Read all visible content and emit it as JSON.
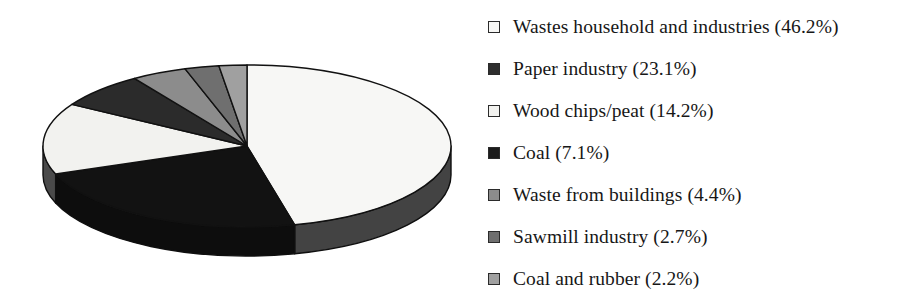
{
  "chart_data": {
    "type": "pie",
    "title": "",
    "subtitle": "",
    "xlabel": "",
    "ylabel": "",
    "legend_position": "right",
    "grid": false,
    "three_d": true,
    "units": "%",
    "start_angle_deg": 0,
    "direction": "clockwise",
    "categories": [
      "Wastes household and industries",
      "Paper industry",
      "Wood chips/peat",
      "Coal",
      "Waste from buildings",
      "Sawmill industry",
      "Coal and rubber"
    ],
    "values": [
      46.2,
      23.1,
      14.2,
      7.1,
      4.4,
      2.7,
      2.2
    ],
    "colors": [
      "#f7f7f5",
      "#121212",
      "#f2f2ef",
      "#2b2b2b",
      "#8c8c8c",
      "#6f6f6f",
      "#a0a0a0"
    ],
    "slices": [
      {
        "label": "Wastes household and industries",
        "value": 46.2,
        "display": "46.2%",
        "color": "#f7f7f5",
        "side_color": "#434343"
      },
      {
        "label": "Paper industry",
        "value": 23.1,
        "display": "23.1%",
        "color": "#121212",
        "side_color": "#0d0d0d"
      },
      {
        "label": "Wood chips/peat",
        "value": 14.2,
        "display": "14.2%",
        "color": "#f2f2ef",
        "side_color": "#4a4a4a"
      },
      {
        "label": "Coal",
        "value": 7.1,
        "display": "7.1%",
        "color": "#2b2b2b",
        "side_color": "#1f1f1f"
      },
      {
        "label": "Waste from buildings",
        "value": 4.4,
        "display": "4.4%",
        "color": "#8c8c8c",
        "side_color": "#5e5e5e"
      },
      {
        "label": "Sawmill industry",
        "value": 2.7,
        "display": "2.7%",
        "color": "#6f6f6f",
        "side_color": "#4c4c4c"
      },
      {
        "label": "Coal and rubber",
        "value": 2.2,
        "display": "2.2%",
        "color": "#a0a0a0",
        "side_color": "#6b6b6b"
      }
    ]
  },
  "legend": {
    "items": [
      {
        "text": "Wastes household and industries (46.2%)",
        "swatch": "#f7f7f5",
        "swatch_name": "legend-swatch-wastes-household-and-industries"
      },
      {
        "text": "Paper industry (23.1%)",
        "swatch": "#2e2e2e",
        "swatch_name": "legend-swatch-paper-industry"
      },
      {
        "text": "Wood chips/peat (14.2%)",
        "swatch": "#f2f2ef",
        "swatch_name": "legend-swatch-wood-chips-peat"
      },
      {
        "text": "Coal (7.1%)",
        "swatch": "#1c1c1c",
        "swatch_name": "legend-swatch-coal"
      },
      {
        "text": "Waste from buildings (4.4%)",
        "swatch": "#8c8c8c",
        "swatch_name": "legend-swatch-waste-from-buildings"
      },
      {
        "text": "Sawmill industry (2.7%)",
        "swatch": "#6f6f6f",
        "swatch_name": "legend-swatch-sawmill-industry"
      },
      {
        "text": "Coal and rubber (2.2%)",
        "swatch": "#a0a0a0",
        "swatch_name": "legend-swatch-coal-and-rubber"
      }
    ]
  }
}
